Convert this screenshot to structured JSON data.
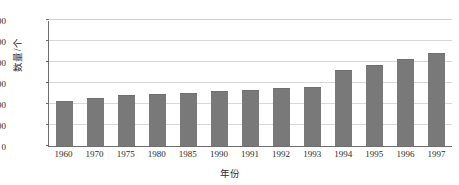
{
  "chart_data": {
    "type": "bar",
    "title": "",
    "subtitle": "",
    "xlabel": "年份",
    "ylabel": "数量/个",
    "categories": [
      "1960",
      "1970",
      "1975",
      "1980",
      "1985",
      "1990",
      "1991",
      "1992",
      "1993",
      "1994",
      "1995",
      "1996",
      "1997"
    ],
    "values": [
      420,
      450,
      475,
      490,
      500,
      515,
      525,
      540,
      548,
      710,
      765,
      818,
      880
    ],
    "ylim": [
      0,
      1200
    ],
    "yticks": [
      0,
      200,
      400,
      600,
      800,
      1000,
      1200
    ],
    "ytick_labels": [
      "0",
      "200",
      "400",
      "600",
      "800",
      "1 000",
      "1 200"
    ],
    "grid": true,
    "legend": null,
    "series_name": "数量",
    "bar_color": "#797979",
    "grid_color": "#d8d8d8",
    "axis_color": "#6d6d6d",
    "background_color": "#ffffff"
  }
}
